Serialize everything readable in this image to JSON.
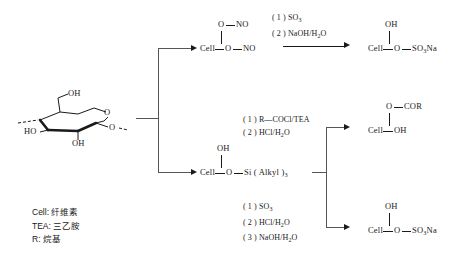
{
  "diagram": {
    "substrate": {
      "name": "cellulose-repeat-unit",
      "ring_oxygen": "O",
      "hydroxymethyl": "OH",
      "c3_hydroxyl": "HO",
      "c2_hydroxyl": "OH",
      "glycosidic_oxygen": "O"
    },
    "branches": [
      {
        "id": "nitration",
        "intermediate": {
          "top_group": "O—NO",
          "main_chain": "Cell—O—NO",
          "cell_label": "Cell",
          "top_o": "O",
          "top_no": "NO",
          "chain_o": "O",
          "chain_no": "NO"
        },
        "reagents": [
          "( 1 ) SO3",
          "( 2 ) NaOH/H2O"
        ],
        "reagent_lines": [
          {
            "num": "( 1 )",
            "formula": "SO",
            "sub": "3",
            "tail": ""
          },
          {
            "num": "( 2 )",
            "formula": "NaOH/H",
            "sub": "2",
            "tail": "O"
          }
        ],
        "product": {
          "top_group": "OH",
          "cell_label": "Cell",
          "chain_o": "O",
          "terminal": "SO3Na",
          "terminal_pre": "SO",
          "terminal_sub": "3",
          "terminal_post": "Na"
        }
      },
      {
        "id": "silylation",
        "intermediate": {
          "top_group": "OH",
          "cell_label": "Cell",
          "chain_o": "O",
          "silyl": "Si ( Alkyl )",
          "silyl_sub": "3"
        }
      },
      {
        "id": "acylation",
        "reagent_lines": [
          {
            "num": "( 1 )",
            "formula": "R—COCl/TEA",
            "sub": "",
            "tail": ""
          },
          {
            "num": "( 2 )",
            "formula": "HCl/H",
            "sub": "2",
            "tail": "O"
          }
        ],
        "product": {
          "top_group": "O—COR",
          "top_o": "O",
          "top_cor": "COR",
          "cell_label": "Cell",
          "terminal": "OH"
        }
      },
      {
        "id": "sulfation",
        "reagent_lines": [
          {
            "num": "( 1 )",
            "formula": "SO",
            "sub": "3",
            "tail": ""
          },
          {
            "num": "( 2 )",
            "formula": "HCl/H",
            "sub": "2",
            "tail": "O"
          },
          {
            "num": "( 3 )",
            "formula": "NaOH/H",
            "sub": "2",
            "tail": "O"
          }
        ],
        "product": {
          "top_group": "OH",
          "cell_label": "Cell",
          "chain_o": "O",
          "terminal_pre": "SO",
          "terminal_sub": "3",
          "terminal_post": "Na"
        }
      }
    ],
    "legend": [
      "Cell: 纤维素",
      "TEA: 三乙胺",
      "R: 烷基"
    ]
  },
  "colors": {
    "ink": "#1a1a1a",
    "rule": "#555555",
    "background": "#ffffff"
  }
}
